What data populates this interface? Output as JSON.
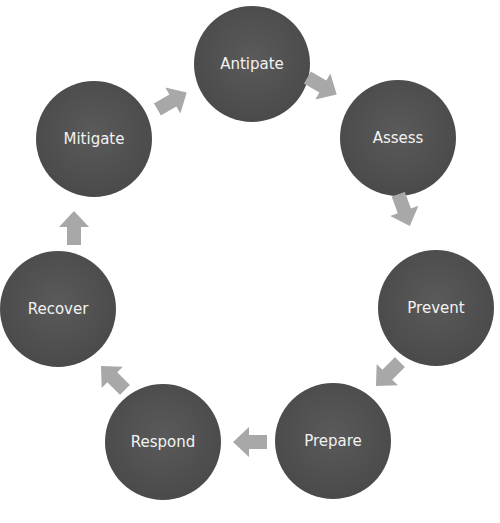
{
  "diagram": {
    "type": "cycle",
    "node_color": "#4d4d4d",
    "arrow_color": "#a6a6a6",
    "label_color": "#f2f2f2",
    "nodes": [
      {
        "label": "Antipate",
        "cx": 252,
        "cy": 64,
        "r": 58
      },
      {
        "label": "Assess",
        "cx": 398,
        "cy": 138,
        "r": 58
      },
      {
        "label": "Prevent",
        "cx": 436,
        "cy": 308,
        "r": 58
      },
      {
        "label": "Prepare",
        "cx": 333,
        "cy": 441,
        "r": 58
      },
      {
        "label": "Respond",
        "cx": 163,
        "cy": 442,
        "r": 58
      },
      {
        "label": "Recover",
        "cx": 58,
        "cy": 309,
        "r": 58
      },
      {
        "label": "Mitigate",
        "cx": 94,
        "cy": 139,
        "r": 58
      }
    ],
    "arrows": [
      {
        "from": "Antipate",
        "to": "Assess",
        "x": 322,
        "y": 86,
        "angle": 30
      },
      {
        "from": "Assess",
        "to": "Prevent",
        "x": 404,
        "y": 210,
        "angle": 70
      },
      {
        "from": "Prevent",
        "to": "Prepare",
        "x": 371,
        "y": 358,
        "angle": 135
      },
      {
        "from": "Prepare",
        "to": "Respond",
        "x": 233,
        "y": 425,
        "angle": 180
      },
      {
        "from": "Respond",
        "to": "Recover",
        "x": 97,
        "y": 362,
        "angle": 225
      },
      {
        "from": "Recover",
        "to": "Mitigate",
        "x": 59,
        "y": 210,
        "angle": 270
      },
      {
        "from": "Mitigate",
        "to": "Antipate",
        "x": 154,
        "y": 86,
        "angle": 330
      }
    ]
  }
}
